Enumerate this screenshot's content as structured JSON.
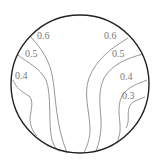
{
  "diagram": {
    "type": "contour-in-circle",
    "boundary": {
      "cx": 80,
      "cy": 84,
      "r": 69,
      "color": "#222222"
    },
    "contour_color": "#8a8a8a",
    "contours": [
      {
        "id": "left-0.6",
        "label": "0.6",
        "label_x": 37,
        "label_y": 39,
        "path": "M31,37 C42,50 50,60 53,80 C56,100 56,125 67,153"
      },
      {
        "id": "left-0.5",
        "label": "0.5",
        "label_x": 25,
        "label_y": 57,
        "path": "M18,55 C28,63 40,68 46,80 C52,95 48,125 52,140 C54,146 56,150 60,151"
      },
      {
        "id": "left-0.4",
        "label": "0.4",
        "label_x": 15,
        "label_y": 79,
        "path": "M13,80 C16,88 22,92 29,96 C34,100 31,110 30,118 C30,126 33,132 37,136"
      },
      {
        "id": "right-0.6",
        "label": "0.6",
        "label_x": 104,
        "label_y": 39,
        "path": "M128,38 C112,48 97,58 89,78 C83,95 90,112 90,130 C90,140 86,148 84,153"
      },
      {
        "id": "right-0.5",
        "label": "0.5",
        "label_x": 112,
        "label_y": 57,
        "path": "M143,54 C128,58 112,64 104,78 C96,95 102,112 101,128 C100,140 98,146 96,151"
      },
      {
        "id": "right-0.4",
        "label": "0.4",
        "label_x": 120,
        "label_y": 80,
        "path": "M147,80 C138,84 128,86 122,96 C116,108 121,120 120,132 C119,137 118,140 117,142"
      },
      {
        "id": "right-0.3",
        "label": "0.3",
        "label_x": 122,
        "label_y": 99,
        "path": "M145,97 C138,100 131,101 129,108 C127,115 130,121 126,128"
      }
    ]
  }
}
